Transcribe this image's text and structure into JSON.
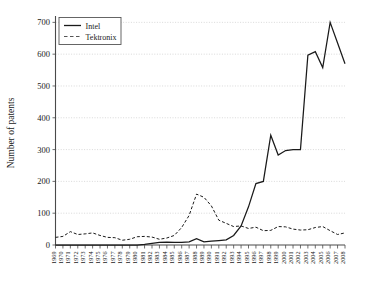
{
  "chart_data": {
    "type": "line",
    "title": "",
    "xlabel": "",
    "ylabel": "Number of patents",
    "ylim": [
      0,
      720
    ],
    "y_ticks": [
      0,
      100,
      200,
      300,
      400,
      500,
      600,
      700
    ],
    "grid": true,
    "legend_position": "top-left",
    "x": [
      1969,
      1970,
      1971,
      1972,
      1973,
      1974,
      1975,
      1976,
      1977,
      1978,
      1979,
      1980,
      1981,
      1982,
      1983,
      1984,
      1985,
      1986,
      1987,
      1988,
      1989,
      1990,
      1991,
      1992,
      1993,
      1994,
      1995,
      1996,
      1997,
      1998,
      1999,
      2000,
      2001,
      2002,
      2003,
      2004,
      2005,
      2006,
      2007,
      2008
    ],
    "categories": [
      "1969",
      "1970",
      "1971",
      "1972",
      "1973",
      "1974",
      "1975",
      "1976",
      "1977",
      "1978",
      "1979",
      "1980",
      "1981",
      "1982",
      "1983",
      "1984",
      "1985",
      "1986",
      "1987",
      "1988",
      "1989",
      "1990",
      "1991",
      "1992",
      "1993",
      "1994",
      "1995",
      "1996",
      "1997",
      "1998",
      "1999",
      "2000",
      "2001",
      "2002",
      "2003",
      "2004",
      "2005",
      "2006",
      "2007",
      "2008"
    ],
    "series": [
      {
        "name": "Intel",
        "style": "solid",
        "color": "#1a1a1a",
        "values": [
          0,
          0,
          0,
          0,
          0,
          0,
          0,
          0,
          0,
          0,
          0,
          0,
          2,
          5,
          8,
          9,
          8,
          8,
          10,
          20,
          10,
          12,
          14,
          16,
          30,
          60,
          120,
          193,
          200,
          345,
          283,
          297,
          300,
          300,
          597,
          608,
          558,
          700,
          635,
          570
        ]
      },
      {
        "name": "Tektronix",
        "style": "dashed",
        "color": "#555555",
        "values": [
          24,
          27,
          42,
          33,
          35,
          38,
          30,
          24,
          23,
          15,
          18,
          26,
          27,
          25,
          18,
          22,
          30,
          55,
          93,
          160,
          150,
          123,
          78,
          68,
          58,
          60,
          52,
          56,
          45,
          46,
          58,
          57,
          50,
          47,
          48,
          55,
          58,
          45,
          33,
          38
        ]
      }
    ]
  },
  "legend": {
    "entries": [
      {
        "label": "Intel"
      },
      {
        "label": "Tektronix"
      }
    ]
  },
  "axes": {
    "y_title": "Number of patents"
  }
}
